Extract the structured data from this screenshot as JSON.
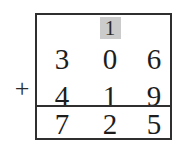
{
  "problem": {
    "operator": "+",
    "carry_row": {
      "hundreds": "",
      "tens": "1",
      "ones": ""
    },
    "addend_1": {
      "hundreds": "3",
      "tens": "0",
      "ones": "6"
    },
    "addend_2": {
      "hundreds": "4",
      "tens": "1",
      "ones": "9"
    },
    "total": {
      "hundreds": "7",
      "tens": "2",
      "ones": "5"
    }
  },
  "colors": {
    "carry_highlight": "#cbcbcb",
    "border": "#2f2f2f",
    "digit": "#1d1d1d",
    "background": "#ffffff"
  }
}
